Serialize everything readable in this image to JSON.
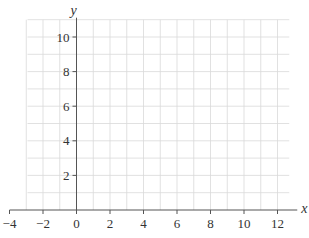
{
  "chart_data": {
    "type": "scatter",
    "title": "",
    "xlabel": "x",
    "ylabel": "y",
    "xlim": [
      -4,
      13
    ],
    "ylim": [
      0,
      11
    ],
    "x_ticks": [
      -4,
      -2,
      0,
      2,
      4,
      6,
      8,
      10,
      12
    ],
    "y_ticks": [
      2,
      4,
      6,
      8,
      10
    ],
    "x_tick_labels": [
      "−4",
      "−2",
      "0",
      "2",
      "4",
      "6",
      "8",
      "10",
      "12"
    ],
    "y_tick_labels": [
      "2",
      "4",
      "6",
      "8",
      "10"
    ],
    "grid": true,
    "grid_step": 1,
    "series": [],
    "colors": {
      "grid": "#d9d9d9",
      "axis": "#555555",
      "text": "#333333"
    }
  }
}
